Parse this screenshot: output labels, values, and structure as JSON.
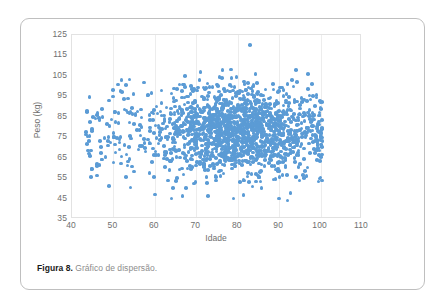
{
  "figure": {
    "caption_label": "Figura 8.",
    "caption_text": "Gráfico de dispersão."
  },
  "chart_data": {
    "type": "scatter",
    "title": "",
    "xlabel": "Idade",
    "ylabel": "Peso (kg)",
    "xlim": [
      40,
      110
    ],
    "ylim": [
      35,
      125
    ],
    "xticks": [
      40,
      50,
      60,
      70,
      80,
      90,
      100,
      110
    ],
    "yticks": [
      35,
      45,
      55,
      65,
      75,
      85,
      95,
      105,
      115,
      125
    ],
    "grid": "vertical",
    "legend": "none",
    "marker_color": "#5b9bd5",
    "marker_size_px": 3.6,
    "point_count_approx": 1600,
    "notable_points": [
      {
        "x": 83,
        "y": 120
      },
      {
        "x": 94,
        "y": 108
      },
      {
        "x": 71,
        "y": 107
      },
      {
        "x": 52,
        "y": 97
      },
      {
        "x": 49,
        "y": 93
      },
      {
        "x": 44,
        "y": 67
      },
      {
        "x": 46,
        "y": 62
      },
      {
        "x": 49,
        "y": 51
      },
      {
        "x": 60,
        "y": 47
      },
      {
        "x": 64,
        "y": 45
      },
      {
        "x": 79,
        "y": 45
      },
      {
        "x": 90,
        "y": 45
      },
      {
        "x": 92,
        "y": 44
      }
    ]
  }
}
